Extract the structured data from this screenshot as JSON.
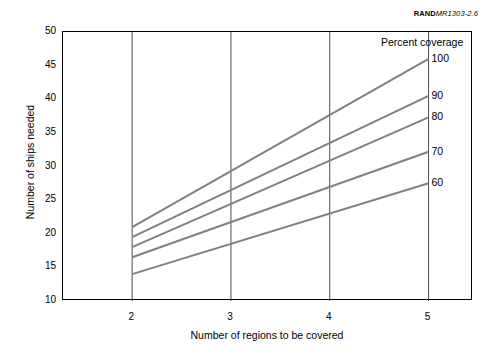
{
  "credit": {
    "brand": "RAND",
    "document": "MR1303-2.6"
  },
  "chart_data": {
    "type": "line",
    "title": "",
    "xlabel": "Number of regions to be covered",
    "ylabel": "Number of ships needed",
    "xlim": [
      1.3,
      5.45
    ],
    "ylim": [
      10,
      50
    ],
    "xticks": [
      2,
      3,
      4,
      5
    ],
    "xticklabels": [
      "2",
      "3",
      "4",
      "5"
    ],
    "yticks": [
      10,
      15,
      20,
      25,
      30,
      35,
      40,
      45,
      50
    ],
    "yticklabels": [
      "10",
      "15",
      "20",
      "25",
      "30",
      "35",
      "40",
      "45",
      "50"
    ],
    "grid": "vertical-only",
    "gridlines_x": [
      2,
      3,
      4,
      5
    ],
    "legend_title": "Percent coverage",
    "legend_position": "line-end-right",
    "line_color": "#808080",
    "line_width": 2,
    "x": [
      2,
      5
    ],
    "series": [
      {
        "name": "100",
        "label": "100",
        "values": [
          21.0,
          46.0
        ]
      },
      {
        "name": "90",
        "label": "90",
        "values": [
          19.5,
          40.5
        ]
      },
      {
        "name": "80",
        "label": "80",
        "values": [
          18.0,
          37.3
        ]
      },
      {
        "name": "70",
        "label": "70",
        "values": [
          16.5,
          32.2
        ]
      },
      {
        "name": "60",
        "label": "60",
        "values": [
          14.0,
          27.5
        ]
      }
    ]
  }
}
